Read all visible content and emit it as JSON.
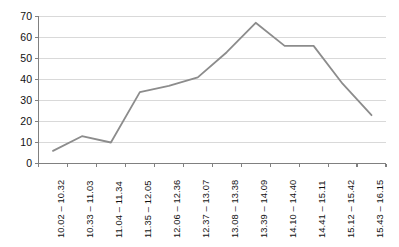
{
  "chart_data": {
    "type": "line",
    "title": "",
    "subtitle": "",
    "xlabel": "",
    "ylabel": "",
    "categories": [
      "10.02 – 10.32",
      "10.33 – 11.03",
      "11.04 – 11.34",
      "11.35 – 12.05",
      "12.06 – 12.36",
      "12.37 – 13.07",
      "13.08 – 13.38",
      "13.39 – 14.09",
      "14.10 – 14.40",
      "14.41 – 15.11",
      "15.12 – 15.42",
      "15.43 – 16.15"
    ],
    "values": [
      6,
      13,
      10,
      34,
      37,
      41,
      53,
      67,
      56,
      56,
      38,
      23
    ],
    "ylim": [
      0,
      70
    ],
    "yticks": [
      0,
      10,
      20,
      30,
      40,
      50,
      60,
      70
    ],
    "ytick_labels": [
      "0",
      "10",
      "20",
      "30",
      "40",
      "50",
      "60",
      "70"
    ],
    "grid": "horizontal",
    "legend": "none",
    "series_color": "#8c8c8c",
    "grid_color": "#d9d9d9",
    "axis_color": "#808080",
    "background": "#ffffff"
  }
}
